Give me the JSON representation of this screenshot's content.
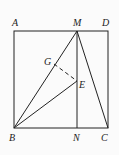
{
  "diagram": {
    "type": "geometry",
    "labels": {
      "A": "A",
      "M": "M",
      "D": "D",
      "G": "G",
      "E": "E",
      "B": "B",
      "N": "N",
      "C": "C"
    },
    "points": {
      "A": [
        14,
        31
      ],
      "D": [
        108,
        31
      ],
      "B": [
        14,
        128
      ],
      "C": [
        108,
        128
      ],
      "M": [
        77,
        31
      ],
      "N": [
        77,
        128
      ],
      "E": [
        77,
        81
      ],
      "G": [
        54,
        64
      ]
    },
    "segments": [
      "AD",
      "DC",
      "CB",
      "BA",
      "MN",
      "MB",
      "MC",
      "BE"
    ],
    "dashed_segments": [
      "GE"
    ],
    "line_color": "#222222"
  }
}
